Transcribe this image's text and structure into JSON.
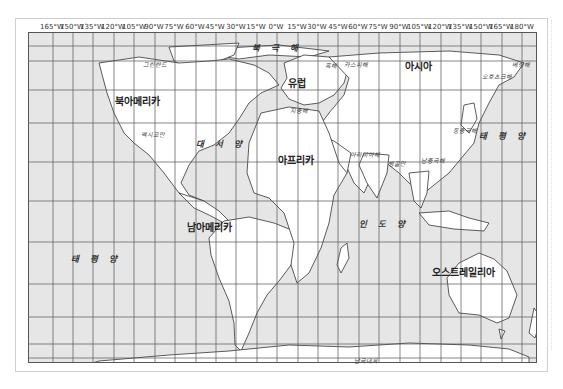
{
  "map": {
    "longitude_labels": [
      "165°W",
      "150°W",
      "135°W",
      "120°W",
      "105°W",
      "90°W",
      "75°W",
      "60°W",
      "45°W",
      "30°W",
      "15°W",
      "0°W",
      "15°W",
      "30°W",
      "45°W",
      "60°W",
      "75°W",
      "90°W",
      "105°W",
      "120°W",
      "135°W",
      "150°W",
      "165°W",
      "180°W"
    ],
    "latitude_labels": [
      "75°N",
      "60°N",
      "45°N",
      "30°N",
      "15°N",
      "0°N",
      "15°N",
      "30°N",
      "45°N",
      "60°N",
      "75°N"
    ],
    "continents": {
      "north_america": "북아메리카",
      "south_america": "남아메리카",
      "europe": "유럽",
      "asia": "아시아",
      "africa": "아프리카",
      "australia": "오스트레일리아",
      "antarctica": "남극대륙"
    },
    "oceans": {
      "arctic": "북 극 해",
      "atlantic": "대 서 양",
      "pacific_west": "태 평 양",
      "pacific_east": "태 평 양",
      "indian": "인 도 양"
    },
    "seas": {
      "greenland": "그린란드",
      "gulf_of_mexico": "멕시코만",
      "black_sea": "흑해",
      "caspian_sea": "카스피해",
      "mediterranean": "지중해",
      "arabian_sea": "아라비아해",
      "bay_of_bengal": "벵골만",
      "south_china_sea": "남중국해",
      "east_china_sea": "동중국해",
      "okhotsk_sea": "오호츠크해",
      "bering_sea": "베링해"
    },
    "colors": {
      "ocean": "#e6e6e6",
      "land": "#ffffff",
      "grid": "#555555",
      "coast": "#333333"
    }
  }
}
